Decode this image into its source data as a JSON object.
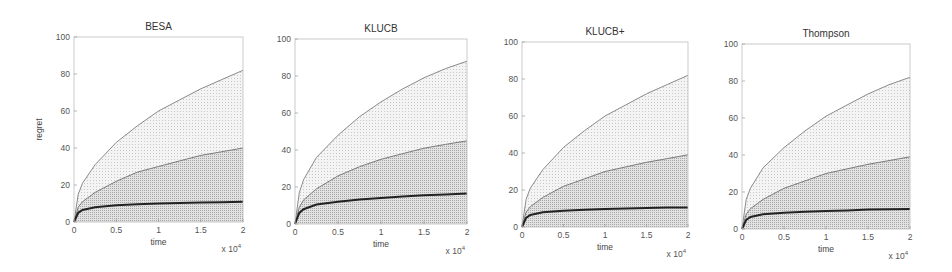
{
  "chart_data": [
    {
      "type": "area",
      "title": "BESA",
      "xlabel": "time",
      "ylabel": "regret",
      "x_multiplier": "x 10^4",
      "xlim": [
        0,
        2
      ],
      "ylim": [
        0,
        100
      ],
      "xticks": [
        "0",
        "0.5",
        "1",
        "1.5",
        "2"
      ],
      "yticks": [
        "0",
        "20",
        "40",
        "60",
        "80",
        "100"
      ],
      "grid": false,
      "x": [
        0,
        0.05,
        0.1,
        0.25,
        0.5,
        0.75,
        1.0,
        1.25,
        1.5,
        1.75,
        2.0
      ],
      "series": [
        {
          "name": "upper quantile",
          "values": [
            0,
            15,
            21,
            31,
            43,
            52,
            60,
            66,
            72,
            77,
            82
          ]
        },
        {
          "name": "middle quantile",
          "values": [
            0,
            8,
            11,
            16,
            22,
            27,
            30,
            33,
            36,
            38,
            40
          ]
        },
        {
          "name": "mean regret",
          "values": [
            0,
            5,
            6.5,
            8,
            9,
            9.6,
            10,
            10.2,
            10.5,
            10.7,
            11
          ]
        }
      ]
    },
    {
      "type": "area",
      "title": "KLUCB",
      "xlabel": "time",
      "ylabel": "",
      "x_multiplier": "x 10^4",
      "xlim": [
        0,
        2
      ],
      "ylim": [
        0,
        100
      ],
      "xticks": [
        "0",
        "0.5",
        "1",
        "1.5",
        "2"
      ],
      "yticks": [
        "0",
        "20",
        "40",
        "60",
        "80",
        "100"
      ],
      "grid": false,
      "x": [
        0,
        0.05,
        0.1,
        0.25,
        0.5,
        0.75,
        1.0,
        1.25,
        1.5,
        1.75,
        2.0
      ],
      "series": [
        {
          "name": "upper quantile",
          "values": [
            0,
            17,
            24,
            36,
            48,
            58,
            66,
            73,
            79,
            84,
            88
          ]
        },
        {
          "name": "middle quantile",
          "values": [
            0,
            9,
            13,
            19,
            26,
            31,
            35,
            38,
            41,
            43,
            45
          ]
        },
        {
          "name": "mean regret",
          "values": [
            0,
            6,
            8,
            10.5,
            12,
            13.3,
            14,
            14.8,
            15.5,
            16,
            16.5
          ]
        }
      ]
    },
    {
      "type": "area",
      "title": "KLUCB+",
      "xlabel": "time",
      "ylabel": "",
      "x_multiplier": "x 10^4",
      "xlim": [
        0,
        2
      ],
      "ylim": [
        0,
        100
      ],
      "xticks": [
        "0",
        "0.5",
        "1",
        "1.5",
        "2"
      ],
      "yticks": [
        "0",
        "20",
        "40",
        "60",
        "80",
        "100"
      ],
      "grid": false,
      "x": [
        0,
        0.05,
        0.1,
        0.25,
        0.5,
        0.75,
        1.0,
        1.25,
        1.5,
        1.75,
        2.0
      ],
      "series": [
        {
          "name": "upper quantile",
          "values": [
            0,
            15,
            21,
            31,
            43,
            52,
            60,
            66,
            72,
            77,
            82
          ]
        },
        {
          "name": "middle quantile",
          "values": [
            0,
            8,
            11,
            16,
            22,
            26,
            30,
            32.5,
            35,
            37,
            39
          ]
        },
        {
          "name": "mean regret",
          "values": [
            0,
            5,
            6.5,
            8,
            8.8,
            9.3,
            9.7,
            10,
            10.3,
            10.5,
            10.5
          ]
        }
      ]
    },
    {
      "type": "area",
      "title": "Thompson",
      "xlabel": "time",
      "ylabel": "",
      "x_multiplier": "x 10^4",
      "xlim": [
        0,
        2
      ],
      "ylim": [
        0,
        100
      ],
      "xticks": [
        "0",
        "0.5",
        "1",
        "1.5",
        "2"
      ],
      "yticks": [
        "0",
        "20",
        "40",
        "60",
        "80",
        "100"
      ],
      "grid": false,
      "x": [
        0,
        0.05,
        0.1,
        0.25,
        0.5,
        0.75,
        1.0,
        1.25,
        1.5,
        1.75,
        2.0
      ],
      "series": [
        {
          "name": "upper quantile",
          "values": [
            0,
            16,
            22,
            33,
            44,
            53,
            61,
            67,
            73,
            78,
            82
          ]
        },
        {
          "name": "middle quantile",
          "values": [
            0,
            8,
            11,
            16,
            22,
            26,
            30,
            32.5,
            35,
            37,
            39
          ]
        },
        {
          "name": "mean regret",
          "values": [
            0,
            5,
            6.5,
            8,
            8.8,
            9.3,
            9.7,
            10,
            10.5,
            10.7,
            10.8
          ]
        }
      ]
    }
  ]
}
